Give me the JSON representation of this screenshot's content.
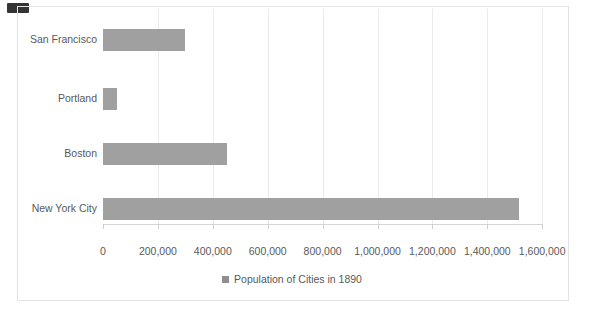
{
  "colors": {
    "bar": "#a0a0a0",
    "legend_marker": "#8f8f8f",
    "text": "#595959",
    "gridline": "#ebebeb",
    "axis_line": "#d6d6d6",
    "tick_mark": "#cfcfcf",
    "frame_border": "#e3e3e3",
    "artifact_mark": "#343434",
    "background": "#ffffff"
  },
  "chart_data": {
    "type": "bar",
    "orientation": "horizontal",
    "title": "",
    "xlabel": "",
    "ylabel": "",
    "categories": [
      "San Francisco",
      "Portland",
      "Boston",
      "New York City"
    ],
    "category_order": "top-to-bottom",
    "values": [
      300000,
      50000,
      450000,
      1515000
    ],
    "series_name": "Population of Cities in 1890",
    "legend": "Population of Cities in 1890",
    "legend_position": "bottom-center",
    "xlim": [
      0,
      1600000
    ],
    "x_tick_step": 200000,
    "x_tick_labels": [
      "0",
      "200,000",
      "400,000",
      "600,000",
      "800,000",
      "1,000,000",
      "1,200,000",
      "1,400,000",
      "1,600,000"
    ],
    "grid": "vertical gridlines on",
    "bar_color_all_series": "#a0a0a0"
  }
}
